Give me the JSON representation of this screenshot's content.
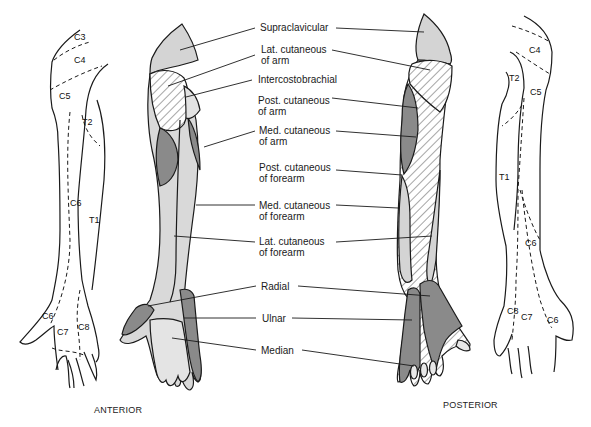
{
  "colors": {
    "light_gray": "#d4d4d4",
    "dark_gray": "#8a8a8a",
    "hatch": "#9a9a9a",
    "outline": "#1a1a1a",
    "background": "#ffffff"
  },
  "nerve_labels": [
    {
      "id": "supraclavicular",
      "line1": "Supraclavicular",
      "line2": ""
    },
    {
      "id": "lat-cutaneous-arm",
      "line1": "Lat. cutaneous",
      "line2": "of arm"
    },
    {
      "id": "intercostobrachial",
      "line1": "Intercostobrachial",
      "line2": ""
    },
    {
      "id": "post-cutaneous-arm",
      "line1": "Post. cutaneous",
      "line2": "of arm"
    },
    {
      "id": "med-cutaneous-arm",
      "line1": "Med. cutaneous",
      "line2": "of arm"
    },
    {
      "id": "post-cutaneous-forearm",
      "line1": "Post. cutaneous",
      "line2": "of forearm"
    },
    {
      "id": "med-cutaneous-forearm",
      "line1": "Med. cutaneous",
      "line2": "of forearm"
    },
    {
      "id": "lat-cutaneous-forearm",
      "line1": "Lat. cutaneous",
      "line2": "of forearm"
    },
    {
      "id": "radial",
      "line1": "Radial",
      "line2": ""
    },
    {
      "id": "ulnar",
      "line1": "Ulnar",
      "line2": ""
    },
    {
      "id": "median",
      "line1": "Median",
      "line2": ""
    }
  ],
  "anterior_dermatomes": [
    "C3",
    "C4",
    "C5",
    "T2",
    "C6",
    "T1",
    "C6",
    "C7",
    "C8"
  ],
  "posterior_dermatomes": [
    "C4",
    "T2",
    "C5",
    "T1",
    "C6",
    "C8",
    "C7",
    "C6"
  ],
  "captions": {
    "anterior": "ANTERIOR",
    "posterior": "POSTERIOR"
  }
}
